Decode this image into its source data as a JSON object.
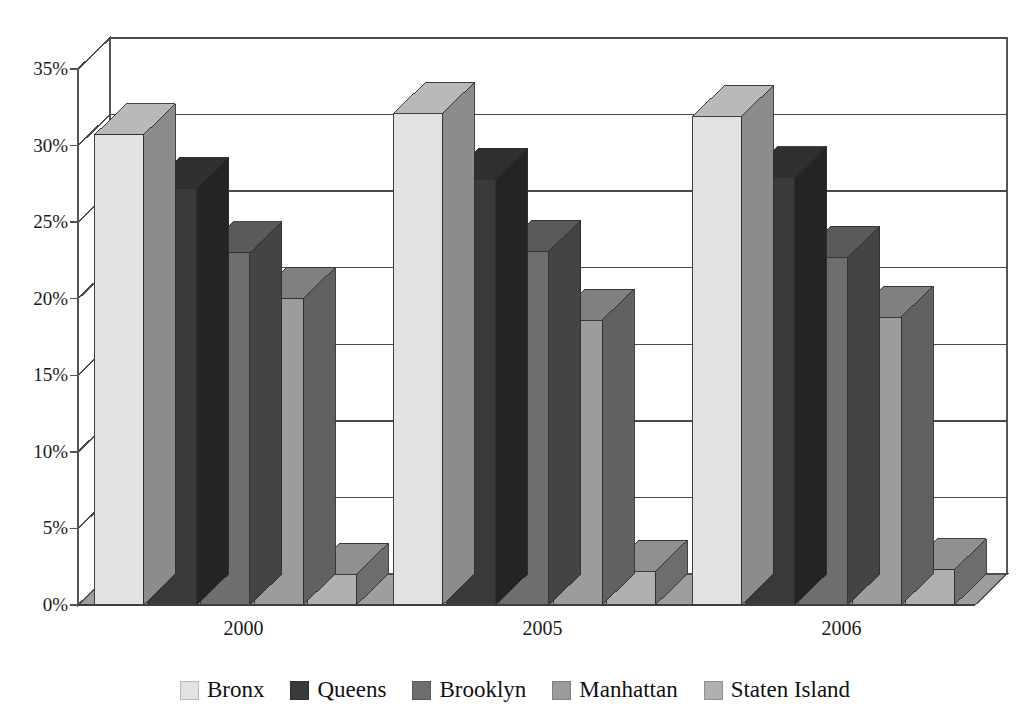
{
  "title": "",
  "chart_data": {
    "type": "bar",
    "title": "",
    "subtitle": "",
    "xlabel": "",
    "ylabel": "",
    "categories": [
      "2000",
      "2005",
      "2006"
    ],
    "series": [
      {
        "name": "Bronx",
        "color": "#e2e2e2",
        "values": [
          30.7,
          32.1,
          31.9
        ]
      },
      {
        "name": "Queens",
        "color": "#3a3a3a",
        "values": [
          27.2,
          27.8,
          27.9
        ]
      },
      {
        "name": "Brooklyn",
        "color": "#6e6e6e",
        "values": [
          23.0,
          23.1,
          22.7
        ]
      },
      {
        "name": "Manhattan",
        "color": "#9c9c9c",
        "values": [
          20.0,
          18.6,
          18.8
        ]
      },
      {
        "name": "Staten Island",
        "color": "#b0b0b0",
        "values": [
          2.0,
          2.2,
          2.3
        ]
      }
    ],
    "ylim": [
      0,
      35
    ],
    "ytick_values": [
      0,
      5,
      10,
      15,
      20,
      25,
      30,
      35
    ],
    "ytick_labels": [
      "0%",
      "5%",
      "10%",
      "15%",
      "20%",
      "25%",
      "30%",
      "35%"
    ],
    "ytick_suffix": "%",
    "grid": true,
    "grid_axis": "y",
    "legend_position": "bottom",
    "three_d": true,
    "plot_bgcolor": "#ffffff",
    "floor_color": "#9e9e9e",
    "wall_color": "#ffffff",
    "axis_line_color": "#555555",
    "grid_line_color": "#4a4a4a"
  },
  "axis": {
    "y_labels": [
      "35%",
      "30%",
      "25%",
      "20%",
      "15%",
      "10%",
      "5%",
      "0%"
    ],
    "x_labels": [
      "2000",
      "2005",
      "2006"
    ]
  },
  "legend": {
    "items": [
      {
        "label": "Bronx",
        "color": "#e2e2e2"
      },
      {
        "label": "Queens",
        "color": "#3a3a3a"
      },
      {
        "label": "Brooklyn",
        "color": "#6e6e6e"
      },
      {
        "label": "Manhattan",
        "color": "#9c9c9c"
      },
      {
        "label": "Staten Island",
        "color": "#b0b0b0"
      }
    ]
  }
}
